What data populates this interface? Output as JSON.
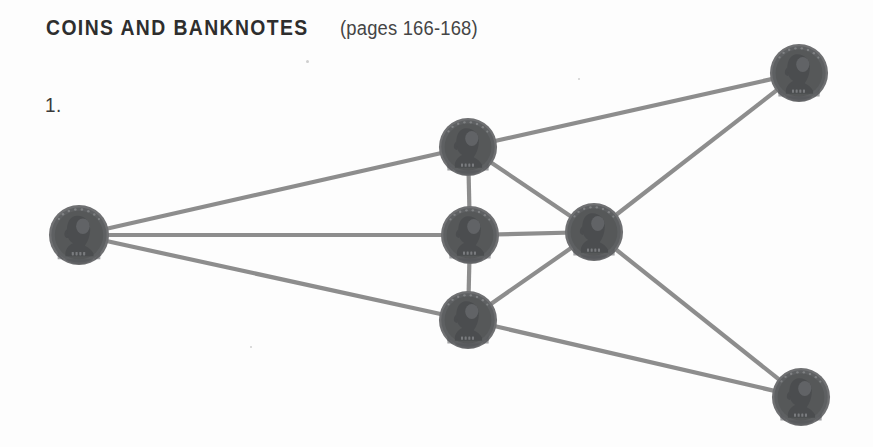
{
  "page": {
    "background_color": "#fdfdfd",
    "width": 873,
    "height": 447
  },
  "heading": {
    "main": "COINS AND BANKNOTES",
    "sub": "(pages 166-168)"
  },
  "item": {
    "number_label": "1."
  },
  "diagram": {
    "node_icon_name": "coin-icon",
    "edge_color": "#8d8d8d",
    "edge_width": 4.2,
    "coin_color": "#5e6062",
    "nodes": [
      {
        "id": "left",
        "label": "coin-left",
        "cx": 79,
        "cy": 235,
        "r": 31
      },
      {
        "id": "top-middle",
        "label": "coin-top-middle",
        "cx": 468,
        "cy": 147,
        "r": 30
      },
      {
        "id": "center",
        "label": "coin-center",
        "cx": 470,
        "cy": 235,
        "r": 30
      },
      {
        "id": "bottom-middle",
        "label": "coin-bottom-middle",
        "cx": 468,
        "cy": 320,
        "r": 30
      },
      {
        "id": "right-center",
        "label": "coin-right-center",
        "cx": 594,
        "cy": 232,
        "r": 30
      },
      {
        "id": "top-right",
        "label": "coin-top-right",
        "cx": 799,
        "cy": 73,
        "r": 30
      },
      {
        "id": "bottom-right",
        "label": "coin-bottom-right",
        "cx": 801,
        "cy": 397,
        "r": 30
      }
    ],
    "edges": [
      {
        "from": "left",
        "to": "top-middle"
      },
      {
        "from": "left",
        "to": "center"
      },
      {
        "from": "left",
        "to": "bottom-middle"
      },
      {
        "from": "top-middle",
        "to": "center"
      },
      {
        "from": "center",
        "to": "bottom-middle"
      },
      {
        "from": "top-middle",
        "to": "top-right"
      },
      {
        "from": "top-middle",
        "to": "right-center"
      },
      {
        "from": "center",
        "to": "right-center"
      },
      {
        "from": "bottom-middle",
        "to": "right-center"
      },
      {
        "from": "right-center",
        "to": "top-right"
      },
      {
        "from": "right-center",
        "to": "bottom-right"
      },
      {
        "from": "bottom-middle",
        "to": "bottom-right"
      }
    ]
  }
}
